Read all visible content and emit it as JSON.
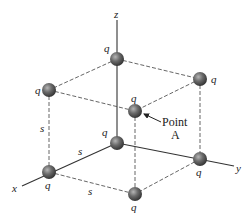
{
  "figure": {
    "type": "cube-of-point-charges",
    "background": "#ffffff",
    "sphere_color": "#5a5a5a",
    "line_color": "#333333"
  },
  "axes": {
    "x_label": "x",
    "y_label": "y",
    "z_label": "z"
  },
  "charges": [
    {
      "id": "origin",
      "label": "q"
    },
    {
      "id": "x-corner",
      "label": "q"
    },
    {
      "id": "y-corner",
      "label": "q"
    },
    {
      "id": "xy-corner",
      "label": "q"
    },
    {
      "id": "z-corner",
      "label": "q"
    },
    {
      "id": "xz-corner",
      "label": "q"
    },
    {
      "id": "yz-corner",
      "label": "q"
    },
    {
      "id": "xyz-corner",
      "label": "q"
    }
  ],
  "edge_labels": {
    "vertical": "s",
    "x_edge": "s",
    "bottom_edge": "s"
  },
  "annotation": {
    "line1": "Point",
    "line2": "A"
  }
}
